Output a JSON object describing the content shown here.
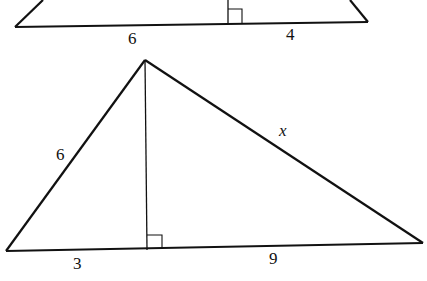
{
  "diagram": {
    "upper_triangle": {
      "labels": {
        "base_left": "6",
        "base_right": "4"
      },
      "right_angle_marker": true
    },
    "lower_triangle": {
      "labels": {
        "left_side": "6",
        "right_side": "x",
        "base_left": "3",
        "base_right": "9"
      },
      "right_angle_marker": true
    },
    "colors": {
      "stroke": "#111111",
      "background": "#ffffff"
    }
  }
}
